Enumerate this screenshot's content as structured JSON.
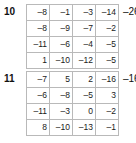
{
  "page": {
    "background_color": "#ffffff",
    "grid_border_color": "#9a9a9a",
    "cell_border_color": "#b9b9b9",
    "text_color": "#1a1a1a"
  },
  "problems": [
    {
      "number": "10",
      "result": "–26",
      "rows": [
        [
          "–8",
          "–1",
          "–3",
          "–14"
        ],
        [
          "–8",
          "–9",
          "–7",
          "–2"
        ],
        [
          "–11",
          "–6",
          "–4",
          "–5"
        ],
        [
          "1",
          "–10",
          "–12",
          "–5"
        ]
      ]
    },
    {
      "number": "11",
      "result": "–16",
      "rows": [
        [
          "–7",
          "5",
          "2",
          "–16"
        ],
        [
          "–6",
          "–8",
          "–5",
          "3"
        ],
        [
          "–11",
          "–3",
          "0",
          "–2"
        ],
        [
          "8",
          "–10",
          "–13",
          "–1"
        ]
      ]
    }
  ]
}
